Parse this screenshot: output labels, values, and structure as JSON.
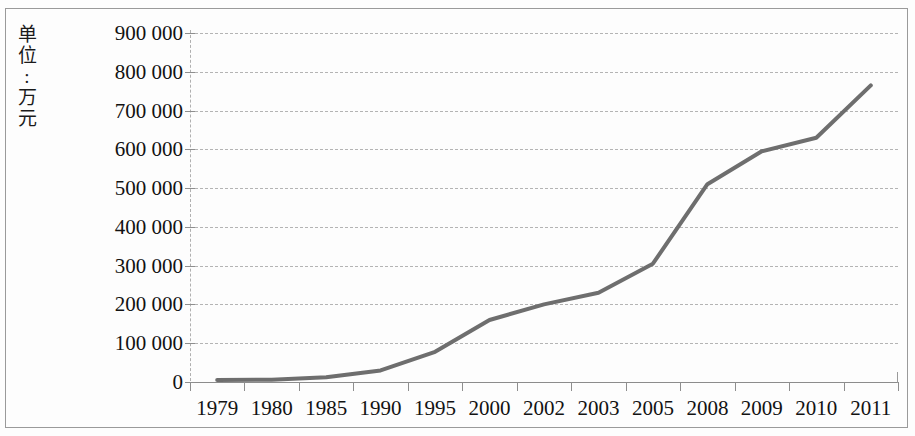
{
  "axis_title": {
    "text": "单位:万元",
    "chars": [
      "单",
      "位",
      ":",
      "万",
      "元"
    ]
  },
  "chart_data": {
    "type": "line",
    "title": "",
    "subtitle": "",
    "xlabel": "",
    "ylabel": "单位:万元",
    "categories": [
      "1979",
      "1980",
      "1985",
      "1990",
      "1995",
      "2000",
      "2002",
      "2003",
      "2005",
      "2008",
      "2009",
      "2010",
      "2011"
    ],
    "values": [
      5000,
      6000,
      12000,
      30000,
      78000,
      160000,
      200000,
      230000,
      305000,
      510000,
      595000,
      630000,
      765000
    ],
    "series": [
      {
        "name": "",
        "values": [
          5000,
          6000,
          12000,
          30000,
          78000,
          160000,
          200000,
          230000,
          305000,
          510000,
          595000,
          630000,
          765000
        ],
        "color": "#6e6e6e"
      }
    ],
    "ylim": [
      0,
      900000
    ],
    "ytick_values": [
      0,
      100000,
      200000,
      300000,
      400000,
      500000,
      600000,
      700000,
      800000,
      900000
    ],
    "ytick_labels": [
      "0",
      "100 000",
      "200 000",
      "300 000",
      "400 000",
      "500 000",
      "600 000",
      "700 000",
      "800 000",
      "900 000"
    ],
    "grid": true,
    "grid_style": "dashed-horizontal",
    "legend": "none",
    "line_width": 4,
    "line_color": "#6e6e6e"
  },
  "colors": {
    "line": "#6e6e6e",
    "grid": "#b4b4b4",
    "axis": "#8c8c8c",
    "frame": "#9a9a9a",
    "text": "#121212"
  }
}
